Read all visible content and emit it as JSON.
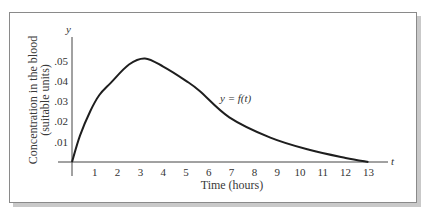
{
  "chart_data": {
    "type": "line",
    "title": "",
    "xlabel": "Time (hours)",
    "ylabel_lines": [
      "Concentration in the blood",
      "(suitable units)"
    ],
    "x_axis_symbol": "t",
    "y_axis_symbol": "y",
    "curve_label": "y = f(t)",
    "x_ticks": [
      "1",
      "2",
      "3",
      "4",
      "5",
      "6",
      "7",
      "8",
      "9",
      "10",
      "11",
      "12",
      "13"
    ],
    "y_ticks": [
      ".01",
      ".02",
      ".03",
      ".04",
      ".05"
    ],
    "xlim": [
      0,
      13
    ],
    "ylim": [
      0,
      0.05
    ],
    "grid": false,
    "legend": "none",
    "series": [
      {
        "name": "y = f(t)",
        "x": [
          0,
          0.35,
          0.8,
          1.2,
          1.7,
          2.5,
          3.2,
          4.0,
          5.0,
          5.6,
          6.9,
          8.7,
          10.4,
          12.0,
          13.0
        ],
        "values": [
          0,
          0.013,
          0.025,
          0.033,
          0.039,
          0.048,
          0.051,
          0.047,
          0.04,
          0.035,
          0.022,
          0.012,
          0.006,
          0.002,
          0
        ]
      }
    ]
  }
}
